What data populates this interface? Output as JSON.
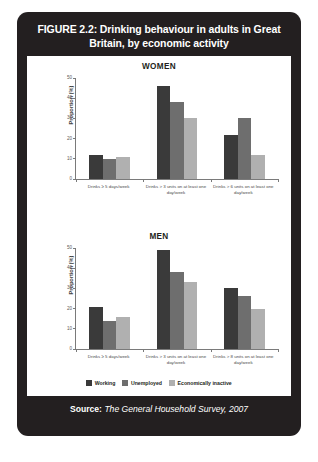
{
  "figure": {
    "title": "FIGURE 2.2: Drinking behaviour in adults in Great Britain, by economic activity",
    "source_label": "Source:",
    "source_text": "The General Household Survey, 2007"
  },
  "legend": {
    "items": [
      {
        "label": "Working",
        "color": "#3a3a3a"
      },
      {
        "label": "Unemployed",
        "color": "#6e6e6e"
      },
      {
        "label": "Economically inactive",
        "color": "#b0b0b0"
      }
    ]
  },
  "chart_data": [
    {
      "type": "bar",
      "title": "WOMEN",
      "xlabel": "",
      "ylabel": "Proportion (%)",
      "ylim": [
        0,
        50
      ],
      "yticks": [
        0,
        10,
        20,
        30,
        40,
        50
      ],
      "grid": false,
      "legend_position": "bottom",
      "categories": [
        "Drinks ≥ 5 days/week",
        "Drinks > 3 units on at least one day/week",
        "Drinks > 6 units on at least one day/week"
      ],
      "series": [
        {
          "name": "Working",
          "color": "#3a3a3a",
          "values": [
            12,
            46,
            22
          ]
        },
        {
          "name": "Unemployed",
          "color": "#6e6e6e",
          "values": [
            10,
            38,
            30
          ]
        },
        {
          "name": "Economically inactive",
          "color": "#b0b0b0",
          "values": [
            11,
            30,
            12
          ]
        }
      ]
    },
    {
      "type": "bar",
      "title": "MEN",
      "xlabel": "",
      "ylabel": "Proportion (%)",
      "ylim": [
        0,
        50
      ],
      "yticks": [
        0,
        10,
        20,
        30,
        40,
        50
      ],
      "grid": false,
      "legend_position": "bottom",
      "categories": [
        "Drinks ≥ 5 days/week",
        "Drinks > 3 units on at least one day/week",
        "Drinks > 8 units on at least one day/week"
      ],
      "series": [
        {
          "name": "Working",
          "color": "#3a3a3a",
          "values": [
            21,
            49,
            30
          ]
        },
        {
          "name": "Unemployed",
          "color": "#6e6e6e",
          "values": [
            14,
            38,
            26
          ]
        },
        {
          "name": "Economically inactive",
          "color": "#b0b0b0",
          "values": [
            16,
            33,
            20
          ]
        }
      ]
    }
  ]
}
